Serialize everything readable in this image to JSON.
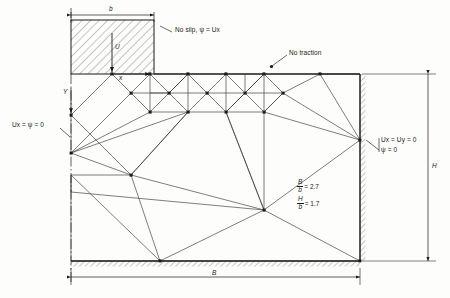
{
  "figure": {
    "type": "finite-element-mesh-diagram"
  },
  "labels": {
    "punch_width": "b",
    "domain_width": "B",
    "domain_height": "H",
    "velocity": "U",
    "axis_x": "x",
    "axis_y": "Y",
    "no_slip": "No slip, ψ = Ux",
    "no_traction": "No traction",
    "left_bc": "Ux = ψ = 0",
    "right_bc_line1": "Ux = Uy = 0",
    "right_bc_line2": "ψ = 0"
  },
  "ratios": [
    {
      "num": "B",
      "den": "b",
      "eq": "= 2.7"
    },
    {
      "num": "H",
      "den": "b",
      "eq": "= 1.7"
    }
  ],
  "colors": {
    "line": "#1a1a1a",
    "mesh": "#3a3a3a",
    "hatch": "#555555",
    "background": "#fdfdfc"
  }
}
